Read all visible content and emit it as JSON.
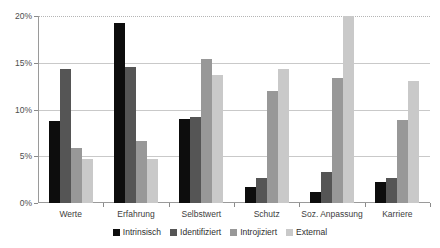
{
  "chart_data": {
    "type": "bar",
    "title": "",
    "xlabel": "",
    "ylabel": "",
    "ylim": [
      0,
      20
    ],
    "ytick_labels": [
      "0%",
      "5%",
      "10%",
      "15%",
      "20%"
    ],
    "ytick_values": [
      0,
      5,
      10,
      15,
      20
    ],
    "grid": true,
    "legend_position": "bottom",
    "categories": [
      "Werte",
      "Erfahrung",
      "Selbstwert",
      "Schutz",
      "Soz. Anpassung",
      "Karriere"
    ],
    "series": [
      {
        "name": "Intrinsisch",
        "color": "#0d0d0d",
        "values": [
          8.8,
          19.3,
          9.0,
          1.7,
          1.2,
          2.2
        ]
      },
      {
        "name": "Identifiziert",
        "color": "#555555",
        "values": [
          14.3,
          14.5,
          9.2,
          2.7,
          3.3,
          2.7
        ]
      },
      {
        "name": "Introjiziert",
        "color": "#989898",
        "values": [
          5.9,
          6.6,
          15.4,
          12.0,
          13.4,
          8.9
        ]
      },
      {
        "name": "External",
        "color": "#c9c9c9",
        "values": [
          4.7,
          4.7,
          13.7,
          14.3,
          20.0,
          13.0
        ]
      }
    ]
  }
}
